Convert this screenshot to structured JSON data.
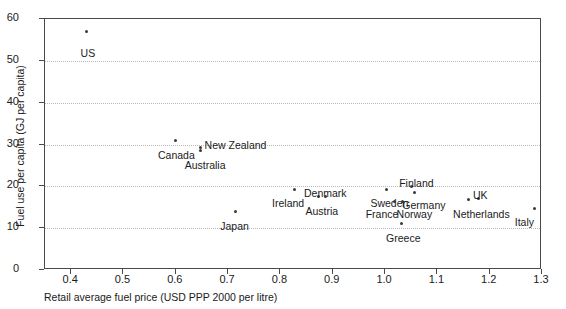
{
  "chart_data": {
    "type": "scatter",
    "xlabel": "Retail average fuel price (USD PPP 2000 per litre)",
    "ylabel": "Fuel use per capita (GJ per capita)",
    "xlim": [
      0.35,
      1.3
    ],
    "ylim": [
      0,
      60
    ],
    "xticks": [
      "0.4",
      "0.5",
      "0.6",
      "0.7",
      "0.8",
      "0.9",
      "1.0",
      "1.1",
      "1.2",
      "1.3"
    ],
    "xtick_values": [
      0.4,
      0.5,
      0.6,
      0.7,
      0.8,
      0.9,
      1.0,
      1.1,
      1.2,
      1.3
    ],
    "yticks": [
      "0",
      "10",
      "20",
      "30",
      "40",
      "50",
      "60"
    ],
    "ytick_values": [
      0,
      10,
      20,
      30,
      40,
      50,
      60
    ],
    "grid": "horizontal-dotted",
    "legend": "none",
    "points": [
      {
        "label": "US",
        "x": 0.43,
        "y": 57.0,
        "lx": 0.418,
        "ly": 53.0,
        "align": "left"
      },
      {
        "label": "Canada",
        "x": 0.6,
        "y": 31.0,
        "lx": 0.566,
        "ly": 28.6,
        "align": "left"
      },
      {
        "label": "New Zealand",
        "x": 0.648,
        "y": 29.3,
        "lx": 0.655,
        "ly": 31.0,
        "align": "left"
      },
      {
        "label": "Australia",
        "x": 0.648,
        "y": 28.5,
        "lx": 0.617,
        "ly": 26.2,
        "align": "left"
      },
      {
        "label": "Japan",
        "x": 0.715,
        "y": 14.0,
        "lx": 0.685,
        "ly": 11.6,
        "align": "left"
      },
      {
        "label": "Ireland",
        "x": 0.826,
        "y": 19.2,
        "lx": 0.784,
        "ly": 17.3,
        "align": "left"
      },
      {
        "label": "Denmark",
        "x": 0.873,
        "y": 17.6,
        "lx": 0.845,
        "ly": 19.6,
        "align": "left"
      },
      {
        "label": "Austria",
        "x": 0.886,
        "y": 17.6,
        "lx": 0.848,
        "ly": 15.3,
        "align": "left"
      },
      {
        "label": "Sweden",
        "x": 1.003,
        "y": 19.2,
        "lx": 0.972,
        "ly": 17.3,
        "align": "left"
      },
      {
        "label": "France",
        "x": 1.018,
        "y": 16.3,
        "lx": 0.963,
        "ly": 14.6,
        "align": "left"
      },
      {
        "label": "Norway",
        "x": 1.034,
        "y": 16.3,
        "lx": 1.022,
        "ly": 14.6,
        "align": "left"
      },
      {
        "label": "Finland",
        "x": 1.05,
        "y": 20.0,
        "lx": 1.027,
        "ly": 22.0,
        "align": "left"
      },
      {
        "label": "Germany",
        "x": 1.057,
        "y": 18.5,
        "lx": 1.033,
        "ly": 16.8,
        "align": "left"
      },
      {
        "label": "Greece",
        "x": 1.032,
        "y": 11.0,
        "lx": 1.002,
        "ly": 8.9,
        "align": "left"
      },
      {
        "label": "Netherlands",
        "x": 1.16,
        "y": 16.8,
        "lx": 1.13,
        "ly": 14.6,
        "align": "left"
      },
      {
        "label": "UK",
        "x": 1.178,
        "y": 17.1,
        "lx": 1.168,
        "ly": 19.2,
        "align": "left"
      },
      {
        "label": "Italy",
        "x": 1.286,
        "y": 14.6,
        "lx": 1.248,
        "ly": 12.6,
        "align": "left"
      }
    ]
  },
  "axes": {
    "x_title": "Retail average fuel price (USD PPP 2000 per litre)",
    "y_title": "Fuel use per capita (GJ per capita)"
  },
  "header": {
    "cut_title": ""
  },
  "colors": {
    "marker": "#3a3a3a",
    "frame": "#4a4a4a",
    "grid": "#b9b9b9",
    "text": "#1a1a1a",
    "background": "#ffffff"
  }
}
